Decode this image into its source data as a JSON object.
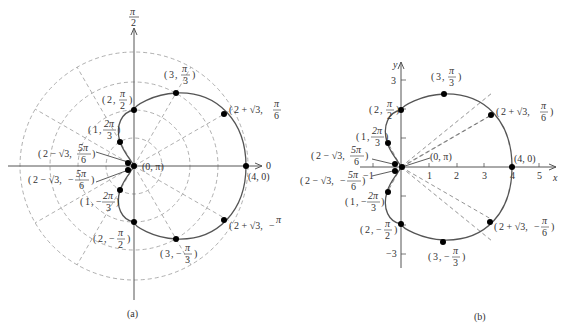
{
  "figure": {
    "equation": "r = 2 + 2cos θ",
    "panels": [
      {
        "id": "a",
        "caption": "(a)",
        "type": "polar",
        "polar_axis_label_right": "0",
        "polar_axis_label_top_num": "π",
        "polar_axis_label_top_den": "2",
        "grid_circles": [
          1,
          2,
          3,
          4
        ],
        "grid_rays_deg": [
          30,
          60,
          120,
          150,
          210,
          240,
          300,
          330
        ]
      },
      {
        "id": "b",
        "caption": "(b)",
        "type": "cartesian",
        "x_axis_label": "x",
        "y_axis_label": "y",
        "x_ticks": [
          "−1",
          "1",
          "2",
          "3",
          "4",
          "5"
        ],
        "y_ticks": [
          "3",
          "−3"
        ]
      }
    ],
    "points": [
      {
        "r": "4",
        "theta": "0",
        "label": "(4, 0)",
        "r_val": 4,
        "theta_deg": 0
      },
      {
        "r": "2 + √3",
        "theta": "π/6",
        "label": "(2 + √3, π/6)",
        "r_val": 3.732,
        "theta_deg": 30
      },
      {
        "r": "3",
        "theta": "π/3",
        "label": "(3, π/3)",
        "r_val": 3,
        "theta_deg": 60
      },
      {
        "r": "2",
        "theta": "π/2",
        "label": "(2, π/2)",
        "r_val": 2,
        "theta_deg": 90
      },
      {
        "r": "1",
        "theta": "2π/3",
        "label": "(1, 2π/3)",
        "r_val": 1,
        "theta_deg": 120
      },
      {
        "r": "2 − √3",
        "theta": "5π/6",
        "label": "(2 − √3, 5π/6)",
        "r_val": 0.268,
        "theta_deg": 150
      },
      {
        "r": "0",
        "theta": "π",
        "label": "(0, π)",
        "r_val": 0,
        "theta_deg": 180
      },
      {
        "r": "2 − √3",
        "theta": "−5π/6",
        "label": "(2 − √3, −5π/6)",
        "r_val": 0.268,
        "theta_deg": -150
      },
      {
        "r": "1",
        "theta": "−2π/3",
        "label": "(1, −2π/3)",
        "r_val": 1,
        "theta_deg": -120
      },
      {
        "r": "2",
        "theta": "−π/2",
        "label": "(2, −π/2)",
        "r_val": 2,
        "theta_deg": -90
      },
      {
        "r": "3",
        "theta": "−π/3",
        "label": "(3, −π/3)",
        "r_val": 3,
        "theta_deg": -60
      },
      {
        "r": "2 + √3",
        "theta": "−π/6",
        "label": "(2 + √3, −π/6)",
        "r_val": 3.732,
        "theta_deg": -30
      }
    ],
    "labels": {
      "a_4_0": "(4, 0)",
      "a_0_pi": "(0, π)",
      "b_4_0": "(4, 0)",
      "b_0_pi": "(0, π)",
      "r_3": "3",
      "r_2": "2",
      "r_1": "1",
      "r_2p3": "2 + √3,",
      "r_2m3": "2 − √3,",
      "pi": "π",
      "two_pi": "2π",
      "five_pi": "5π",
      "den_2": "2",
      "den_3": "3",
      "den_6": "6",
      "minus": "−"
    }
  }
}
